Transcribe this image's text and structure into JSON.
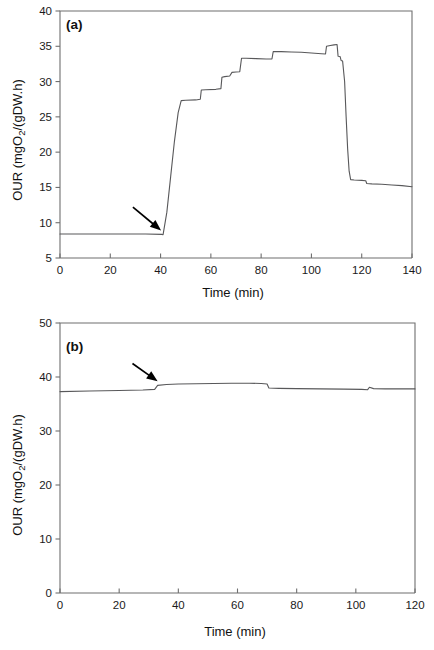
{
  "figure": {
    "name": "oxygen-uptake-rate-figure",
    "background": "#ffffff",
    "line_color": "#58585a",
    "axis_color": "#6f6f6f",
    "arrow_color": "#000000"
  },
  "chart_data": [
    {
      "type": "line",
      "panel_label": "(a)",
      "title": "",
      "xlabel": "Time (min)",
      "ylabel": "OUR (mgO2/(gDW.h)",
      "ylabel_parts": {
        "pre": "OUR (mgO",
        "sub": "2",
        "post": "/(gDW.h)"
      },
      "xlim": [
        0,
        140
      ],
      "ylim": [
        5,
        40
      ],
      "xticks": [
        0,
        20,
        40,
        60,
        80,
        100,
        120,
        140
      ],
      "yticks": [
        5,
        10,
        15,
        20,
        25,
        30,
        35,
        40
      ],
      "grid": false,
      "legend": "none",
      "annotations": [
        {
          "name": "arrow-annotation-a",
          "type": "arrow",
          "tail": {
            "x": 29.0,
            "y": 12.2
          },
          "tip": {
            "x": 40.2,
            "y": 8.9
          }
        }
      ],
      "series": [
        {
          "name": "OUR",
          "points": [
            [
              0,
              8.4
            ],
            [
              18,
              8.4
            ],
            [
              34,
              8.4
            ],
            [
              40.5,
              8.35
            ],
            [
              41.0,
              8.3
            ],
            [
              42.5,
              11.5
            ],
            [
              44.0,
              16.5
            ],
            [
              45.5,
              21.5
            ],
            [
              47.0,
              25.6
            ],
            [
              48.2,
              27.3
            ],
            [
              50.0,
              27.35
            ],
            [
              54.0,
              27.4
            ],
            [
              55.8,
              27.5
            ],
            [
              56.2,
              28.8
            ],
            [
              58.0,
              28.85
            ],
            [
              62.0,
              28.9
            ],
            [
              64.0,
              29.0
            ],
            [
              64.4,
              30.6
            ],
            [
              65.5,
              30.7
            ],
            [
              67.5,
              30.8
            ],
            [
              68.4,
              31.3
            ],
            [
              70.0,
              31.35
            ],
            [
              71.5,
              31.4
            ],
            [
              72.2,
              33.3
            ],
            [
              74.0,
              33.3
            ],
            [
              78.0,
              33.25
            ],
            [
              82.0,
              33.2
            ],
            [
              84.3,
              33.2
            ],
            [
              84.8,
              34.25
            ],
            [
              88.0,
              34.25
            ],
            [
              92.0,
              34.2
            ],
            [
              96.0,
              34.15
            ],
            [
              100.0,
              34.05
            ],
            [
              104.0,
              33.95
            ],
            [
              105.6,
              33.9
            ],
            [
              106.0,
              35.0
            ],
            [
              107.5,
              35.1
            ],
            [
              109.0,
              35.2
            ],
            [
              110.2,
              35.25
            ],
            [
              110.6,
              33.6
            ],
            [
              111.4,
              33.55
            ],
            [
              111.8,
              33.0
            ],
            [
              112.4,
              32.9
            ],
            [
              113.2,
              30.0
            ],
            [
              113.8,
              25.0
            ],
            [
              114.4,
              20.5
            ],
            [
              115.0,
              17.3
            ],
            [
              115.6,
              16.1
            ],
            [
              117.0,
              16.05
            ],
            [
              120.0,
              16.0
            ],
            [
              121.6,
              15.95
            ],
            [
              122.0,
              15.55
            ],
            [
              124.0,
              15.5
            ],
            [
              128.0,
              15.45
            ],
            [
              132.0,
              15.35
            ],
            [
              136.0,
              15.25
            ],
            [
              140.0,
              15.1
            ]
          ]
        }
      ]
    },
    {
      "type": "line",
      "panel_label": "(b)",
      "title": "",
      "xlabel": "Time (min)",
      "ylabel": "OUR (mgO2/(gDW.h)",
      "ylabel_parts": {
        "pre": "OUR (mgO",
        "sub": "2",
        "post": "/(gDW.h)"
      },
      "xlim": [
        0,
        120
      ],
      "ylim": [
        0,
        50
      ],
      "xticks": [
        0,
        20,
        40,
        60,
        80,
        100,
        120
      ],
      "yticks": [
        0,
        10,
        20,
        30,
        40,
        50
      ],
      "grid": false,
      "legend": "none",
      "annotations": [
        {
          "name": "arrow-annotation-b",
          "type": "arrow",
          "tail": {
            "x": 24.5,
            "y": 42.5
          },
          "tip": {
            "x": 33.0,
            "y": 39.2
          }
        }
      ],
      "series": [
        {
          "name": "OUR",
          "points": [
            [
              0,
              37.3
            ],
            [
              10,
              37.4
            ],
            [
              20,
              37.5
            ],
            [
              28,
              37.6
            ],
            [
              32.0,
              37.7
            ],
            [
              33.0,
              38.45
            ],
            [
              36.0,
              38.6
            ],
            [
              40.0,
              38.7
            ],
            [
              46.0,
              38.75
            ],
            [
              52.0,
              38.8
            ],
            [
              58.0,
              38.85
            ],
            [
              64.0,
              38.85
            ],
            [
              68.0,
              38.8
            ],
            [
              70.0,
              38.7
            ],
            [
              70.6,
              37.95
            ],
            [
              74.0,
              37.9
            ],
            [
              80.0,
              37.85
            ],
            [
              88.0,
              37.8
            ],
            [
              96.0,
              37.75
            ],
            [
              102.0,
              37.7
            ],
            [
              104.0,
              37.65
            ],
            [
              104.6,
              38.1
            ],
            [
              106.0,
              37.85
            ],
            [
              110.0,
              37.8
            ],
            [
              115.0,
              37.8
            ],
            [
              120.0,
              37.8
            ]
          ]
        }
      ]
    }
  ]
}
